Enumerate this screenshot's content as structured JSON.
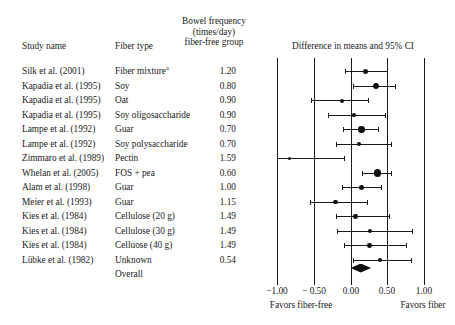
{
  "headers": {
    "study_name": "Study name",
    "fiber_type": "Fiber type",
    "bowel_line1": "Bowel frequency",
    "bowel_line2": "(times/day)",
    "bowel_line3": "fiber-free group",
    "difference": "Difference in means and 95% CI"
  },
  "rows": [
    {
      "study": "Silk et al. (2001)",
      "fiber": "Fiber mixture",
      "superscript": "a",
      "bowel": "1.20"
    },
    {
      "study": "Kapadia et al. (1995)",
      "fiber": "Soy",
      "bowel": "0.80"
    },
    {
      "study": "Kapadia et al. (1995)",
      "fiber": "Oat",
      "bowel": "0.90"
    },
    {
      "study": "Kapadia et al. (1995)",
      "fiber": "Soy oligosaccharide",
      "bowel": "0.90"
    },
    {
      "study": "Lampe et al. (1992)",
      "fiber": "Guar",
      "bowel": "0.70"
    },
    {
      "study": "Lampe et al. (1992)",
      "fiber": "Soy polysaccharide",
      "bowel": "0.70"
    },
    {
      "study": "Zimmaro et al. (1989)",
      "fiber": "Pectin",
      "bowel": "1.59"
    },
    {
      "study": "Whelan et al. (2005)",
      "fiber": "FOS + pea",
      "bowel": "0.60"
    },
    {
      "study": "Alam et al. (1998)",
      "fiber": "Guar",
      "bowel": "1.00"
    },
    {
      "study": "Meier  et al. (1993)",
      "fiber": "Guar",
      "bowel": "1.15"
    },
    {
      "study": "Kies  et al. (1984)",
      "fiber": "Cellulose (20 g)",
      "bowel": "1.49"
    },
    {
      "study": "Kies et al. (1984)",
      "fiber": "Cellulose (30 g)",
      "bowel": "1.49"
    },
    {
      "study": "Kies et al. (1984)",
      "fiber": "Celluose (40 g)",
      "bowel": "1.49"
    },
    {
      "study": "Lübke et al. (1982)",
      "fiber": "Unknown",
      "bowel": "0.54"
    }
  ],
  "overall_label": "Overall",
  "axis": {
    "ticks": [
      "−1.00",
      "− 0.50",
      "0.00",
      "0.50",
      "1.00"
    ],
    "tick_values": [
      -1.0,
      -0.5,
      0.0,
      0.5,
      1.0
    ],
    "favors_left": "Favors fiber-free",
    "favors_right": "Favors fiber"
  },
  "chart_data": {
    "type": "forest",
    "title": "Difference in means and 95% CI",
    "xlabel": "Difference in means",
    "xlim": [
      -1.0,
      1.0
    ],
    "grid": true,
    "null_line": 0.0,
    "effect_measure": "Difference in means",
    "studies": [
      {
        "label": "Silk et al. (2001)",
        "fiber": "Fiber mixture",
        "bowel_frequency": 1.2,
        "estimate": 0.2,
        "ci_low": -0.08,
        "ci_high": 0.5,
        "weight": 3.4
      },
      {
        "label": "Kapadia et al. (1995)",
        "fiber": "Soy",
        "bowel_frequency": 0.8,
        "estimate": 0.35,
        "ci_low": 0.04,
        "ci_high": 0.61,
        "weight": 4.0
      },
      {
        "label": "Kapadia et al. (1995)",
        "fiber": "Oat",
        "bowel_frequency": 0.9,
        "estimate": -0.12,
        "ci_low": -0.54,
        "ci_high": 0.24,
        "weight": 2.3
      },
      {
        "label": "Kapadia et al. (1995)",
        "fiber": "Soy oligosaccharide",
        "bowel_frequency": 0.9,
        "estimate": 0.05,
        "ci_low": -0.3,
        "ci_high": 0.47,
        "weight": 2.1
      },
      {
        "label": "Lampe et al. (1992)",
        "fiber": "Guar",
        "bowel_frequency": 0.7,
        "estimate": 0.15,
        "ci_low": -0.1,
        "ci_high": 0.38,
        "weight": 4.2
      },
      {
        "label": "Lampe et al. (1992)",
        "fiber": "Soy polysaccharide",
        "bowel_frequency": 0.7,
        "estimate": 0.11,
        "ci_low": -0.2,
        "ci_high": 0.55,
        "weight": 2.3
      },
      {
        "label": "Zimmaro et al. (1989)",
        "fiber": "Pectin",
        "bowel_frequency": 1.59,
        "estimate": -0.83,
        "ci_low": -1.0,
        "ci_high": -0.09,
        "weight": 1.7
      },
      {
        "label": "Whelan et al. (2005)",
        "fiber": "FOS + pea",
        "bowel_frequency": 0.6,
        "estimate": 0.37,
        "ci_low": 0.15,
        "ci_high": 0.55,
        "weight": 5.2
      },
      {
        "label": "Alam et al. (1998)",
        "fiber": "Guar",
        "bowel_frequency": 1.0,
        "estimate": 0.15,
        "ci_low": -0.12,
        "ci_high": 0.42,
        "weight": 3.3
      },
      {
        "label": "Meier  et al. (1993)",
        "fiber": "Guar",
        "bowel_frequency": 1.15,
        "estimate": -0.2,
        "ci_low": -0.55,
        "ci_high": 0.22,
        "weight": 2.9
      },
      {
        "label": "Kies  et al. (1984)",
        "fiber": "Cellulose (20 g)",
        "bowel_frequency": 1.49,
        "estimate": 0.07,
        "ci_low": -0.2,
        "ci_high": 0.52,
        "weight": 2.6
      },
      {
        "label": "Kies et al. (1984)",
        "fiber": "Cellulose (30 g)",
        "bowel_frequency": 1.49,
        "estimate": 0.27,
        "ci_low": -0.18,
        "ci_high": 0.83,
        "weight": 2.3
      },
      {
        "label": "Kies et al. (1984)",
        "fiber": "Celluose (40 g)",
        "bowel_frequency": 1.49,
        "estimate": 0.26,
        "ci_low": -0.09,
        "ci_high": 0.75,
        "weight": 2.6
      },
      {
        "label": "Lübke et al. (1982)",
        "fiber": "Unknown",
        "bowel_frequency": 0.54,
        "estimate": 0.4,
        "ci_low": 0.04,
        "ci_high": 0.82,
        "weight": 2.3
      }
    ],
    "overall": {
      "label": "Overall",
      "estimate": 0.14,
      "ci_low": 0.0,
      "ci_high": 0.28
    }
  },
  "geometry": {
    "x_left_value": -1.0,
    "x_left_px": 277,
    "x_right_value": 1.0,
    "x_right_px": 424,
    "row_top_px": 65,
    "row_step_px": 14.5,
    "grid_top_px": 58,
    "grid_bottom_px": 281,
    "overall_row_px": 268,
    "axis_y_px": 281
  }
}
